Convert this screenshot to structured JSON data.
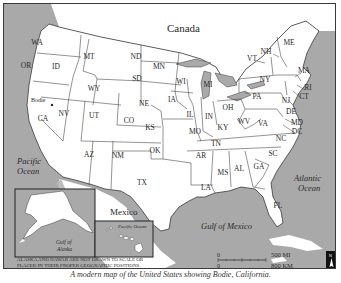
{
  "map": {
    "title_region": "Canada",
    "regions": {
      "canada": "Canada",
      "mexico": "Mexico",
      "pacific_ocean": [
        "Pacific",
        "Ocean"
      ],
      "atlantic_ocean": [
        "Atlantic",
        "Ocean"
      ],
      "gulf_of_mexico": "Gulf of Mexico",
      "gulf_of_alaska": [
        "Gulf of",
        "Alaska"
      ],
      "inset_pacific_ocean": "Pacific Ocean"
    },
    "marker": {
      "label": "Bodie",
      "state": "CA"
    },
    "states": [
      {
        "abbr": "WA",
        "x": 36,
        "y": 44
      },
      {
        "abbr": "OR",
        "x": 25,
        "y": 67
      },
      {
        "abbr": "ID",
        "x": 55,
        "y": 68
      },
      {
        "abbr": "MT",
        "x": 88,
        "y": 58
      },
      {
        "abbr": "ND",
        "x": 135,
        "y": 58
      },
      {
        "abbr": "SD",
        "x": 136,
        "y": 80
      },
      {
        "abbr": "WY",
        "x": 93,
        "y": 90
      },
      {
        "abbr": "NE",
        "x": 143,
        "y": 105
      },
      {
        "abbr": "MN",
        "x": 158,
        "y": 68
      },
      {
        "abbr": "WI",
        "x": 180,
        "y": 83
      },
      {
        "abbr": "MI",
        "x": 207,
        "y": 86
      },
      {
        "abbr": "IA",
        "x": 171,
        "y": 101
      },
      {
        "abbr": "IL",
        "x": 189,
        "y": 116
      },
      {
        "abbr": "IN",
        "x": 208,
        "y": 118
      },
      {
        "abbr": "OH",
        "x": 227,
        "y": 109
      },
      {
        "abbr": "PA",
        "x": 256,
        "y": 98
      },
      {
        "abbr": "NY",
        "x": 264,
        "y": 81
      },
      {
        "abbr": "VT",
        "x": 251,
        "y": 60
      },
      {
        "abbr": "NH",
        "x": 265,
        "y": 53
      },
      {
        "abbr": "ME",
        "x": 288,
        "y": 44
      },
      {
        "abbr": "MA",
        "x": 303,
        "y": 72
      },
      {
        "abbr": "RI",
        "x": 307,
        "y": 89
      },
      {
        "abbr": "CT",
        "x": 303,
        "y": 98
      },
      {
        "abbr": "NJ",
        "x": 285,
        "y": 102
      },
      {
        "abbr": "DE",
        "x": 290,
        "y": 113
      },
      {
        "abbr": "MD",
        "x": 296,
        "y": 124
      },
      {
        "abbr": "DC",
        "x": 296,
        "y": 133
      },
      {
        "abbr": "WV",
        "x": 243,
        "y": 123
      },
      {
        "abbr": "VA",
        "x": 262,
        "y": 125
      },
      {
        "abbr": "KY",
        "x": 222,
        "y": 129
      },
      {
        "abbr": "NC",
        "x": 280,
        "y": 140
      },
      {
        "abbr": "TN",
        "x": 215,
        "y": 145
      },
      {
        "abbr": "SC",
        "x": 272,
        "y": 155
      },
      {
        "abbr": "GA",
        "x": 258,
        "y": 168
      },
      {
        "abbr": "AL",
        "x": 238,
        "y": 170
      },
      {
        "abbr": "MS",
        "x": 222,
        "y": 174
      },
      {
        "abbr": "AR",
        "x": 200,
        "y": 157
      },
      {
        "abbr": "LA",
        "x": 205,
        "y": 189
      },
      {
        "abbr": "FL",
        "x": 277,
        "y": 207
      },
      {
        "abbr": "MO",
        "x": 194,
        "y": 133
      },
      {
        "abbr": "KS",
        "x": 149,
        "y": 129
      },
      {
        "abbr": "OK",
        "x": 154,
        "y": 152
      },
      {
        "abbr": "TX",
        "x": 141,
        "y": 184
      },
      {
        "abbr": "NM",
        "x": 117,
        "y": 157
      },
      {
        "abbr": "AZ",
        "x": 88,
        "y": 156
      },
      {
        "abbr": "CO",
        "x": 128,
        "y": 122
      },
      {
        "abbr": "UT",
        "x": 93,
        "y": 117
      },
      {
        "abbr": "NV",
        "x": 63,
        "y": 115
      },
      {
        "abbr": "CA",
        "x": 42,
        "y": 120
      },
      {
        "abbr": "AK",
        "x": 45,
        "y": 215
      },
      {
        "abbr": "HI",
        "x": 148,
        "y": 238
      }
    ],
    "inset_note": [
      "ALASKA AND HAWAII ARE NOT DRAWN TO SCALE OR",
      "PLACED IN THEIR PROPER GEOGRAPHIC POSITIONS."
    ],
    "scale": {
      "zero_top": "0",
      "mi_label": "500 MI",
      "zero_bottom": "0",
      "km_label": "800 KM"
    },
    "north_arrow": {
      "label": "N"
    },
    "colors": {
      "land": "#ffffff",
      "water": "#a9a9a9",
      "border": "#3a3a3a",
      "text": "#2a2a2a"
    }
  },
  "caption": "A modern map of the United States showing Bodie, California."
}
